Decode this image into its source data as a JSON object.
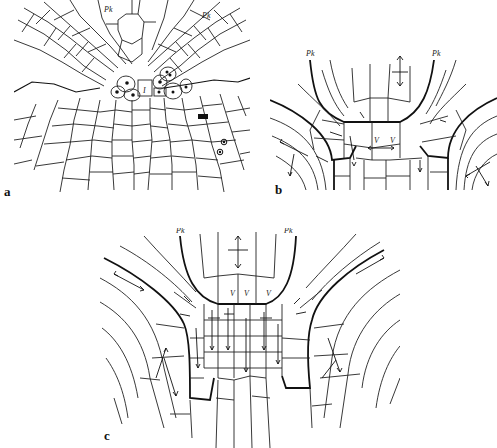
{
  "figure": {
    "panels": [
      {
        "id": "a",
        "letter": "a",
        "labels": {
          "pk_left": "Pk",
          "pk_right": "Pk",
          "initial": "I"
        },
        "description": "Root apex cell network with marked nuclei in central initial cells"
      },
      {
        "id": "b",
        "letter": "b",
        "labels": {
          "pk_left": "Pk",
          "pk_right": "Pk",
          "v_left": "V",
          "v_right": "V"
        },
        "description": "Schematic of cell files with growth direction arrows"
      },
      {
        "id": "c",
        "letter": "c",
        "labels": {
          "pk_left": "Pk",
          "pk_right": "Pk",
          "v_1": "V",
          "v_2": "V",
          "v_3": "V"
        },
        "description": "Expanded schematic of cell files with growth direction arrows"
      }
    ],
    "colors": {
      "line": "#222222",
      "background": "#ffffff"
    }
  }
}
